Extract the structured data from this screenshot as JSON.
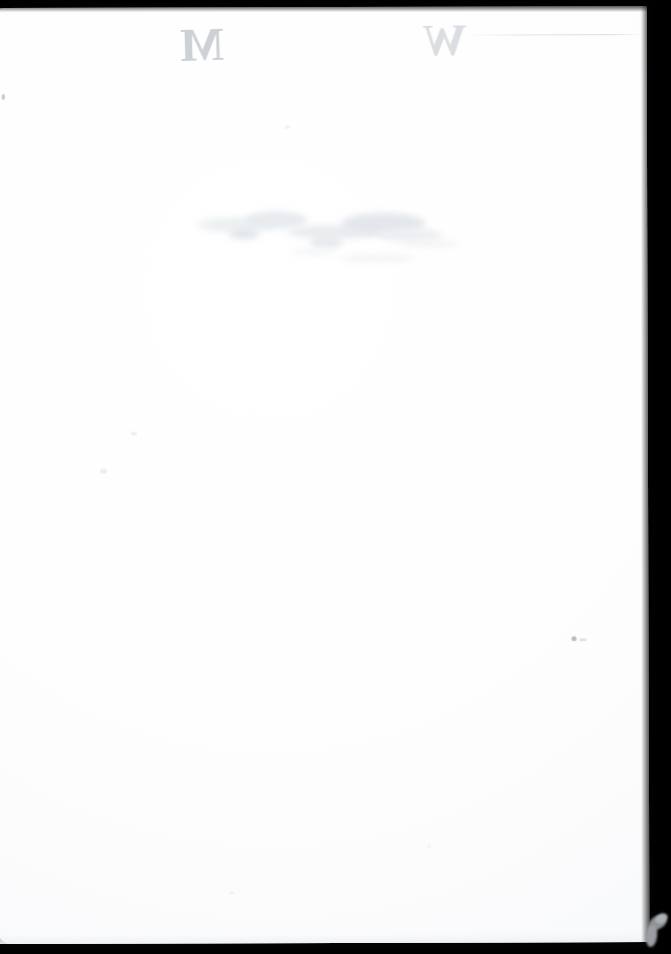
{
  "document": {
    "kind": "scanned-page",
    "side": "verso",
    "content_state": "blank",
    "page_width_px": 671,
    "page_height_px": 954,
    "visible_text_count": 2,
    "colors": {
      "scanner_backdrop": "#030303",
      "paper_white": "#ffffff",
      "paper_shadow_edge": "#c1c5c9",
      "bleed_ink_light": "#d4d8dc",
      "bleed_ink_dark": "#c9ced3",
      "smudge_grey": "#e6eaee",
      "speck_grey": "#c5c9cd",
      "corner_wedge_grey": "#9a9ea2"
    }
  },
  "marks": {
    "bleed_letters": [
      {
        "name": "bleed-letter-left",
        "glyph": "M",
        "appearance": "mirrored",
        "x": 215,
        "y": 42,
        "note": "faint show-through letter, reversed"
      },
      {
        "name": "bleed-letter-right",
        "glyph": "W",
        "appearance": "mirrored",
        "x": 455,
        "y": 40,
        "note": "faint show-through letter, reversed"
      }
    ],
    "smudge": {
      "name": "ink-bleed-smudge",
      "x": 196,
      "y": 196,
      "width": 262,
      "height": 66,
      "note": "mottled grey show-through stain across mid-upper page"
    },
    "crease": {
      "name": "crease-line",
      "x": 472,
      "y": 28,
      "width": 178,
      "note": "faint horizontal fold line near top right"
    },
    "specks": [
      {
        "name": "speck-left-upper",
        "x": 7,
        "y": 86
      },
      {
        "name": "speck-mid-left-a",
        "x": 135,
        "y": 424
      },
      {
        "name": "speck-mid-left-b",
        "x": 104,
        "y": 461
      },
      {
        "name": "speck-right-lower",
        "x": 575,
        "y": 630
      },
      {
        "name": "speck-upper-mid",
        "x": 290,
        "y": 118
      },
      {
        "name": "speck-bottom-a",
        "x": 232,
        "y": 884
      },
      {
        "name": "speck-bottom-b",
        "x": 430,
        "y": 838
      }
    ],
    "corner_wedge": {
      "name": "page-corner-wedge",
      "x": 650,
      "y": 918,
      "width": 20,
      "height": 30,
      "note": "small grey lifted page corner against dark scanner bed"
    }
  },
  "edges": {
    "top_band_height": 8,
    "right_band_width": 26,
    "bottom_band_height": 9,
    "left_band_width": 0
  }
}
